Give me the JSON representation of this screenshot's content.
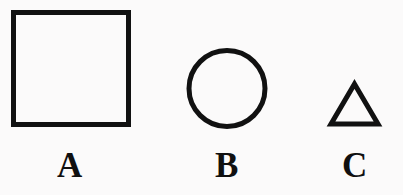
{
  "figure": {
    "background_color": "#fbfafa",
    "stroke_color": "#111111",
    "label_color": "#101010"
  },
  "shapes": [
    {
      "id": "square",
      "kind": "square",
      "label": "A",
      "stroke_width": 5,
      "bounds": {
        "x": 11,
        "y": 10,
        "width": 120,
        "height": 117
      },
      "center_x": 71
    },
    {
      "id": "circle",
      "kind": "circle",
      "label": "B",
      "stroke_width": 5,
      "bounds": {
        "x": 186,
        "y": 48,
        "width": 82,
        "height": 81
      },
      "center_x": 227,
      "radius": 38.5
    },
    {
      "id": "triangle",
      "kind": "triangle",
      "label": "C",
      "stroke_width": 5,
      "bounds": {
        "x": 329,
        "y": 81,
        "width": 51,
        "height": 46
      },
      "center_x": 355,
      "apex": {
        "x": 354.5,
        "y": 83
      },
      "base_left": {
        "x": 331,
        "y": 124
      },
      "base_right": {
        "x": 378,
        "y": 124
      }
    }
  ],
  "labels": {
    "a": "A",
    "b": "B",
    "c": "C"
  }
}
